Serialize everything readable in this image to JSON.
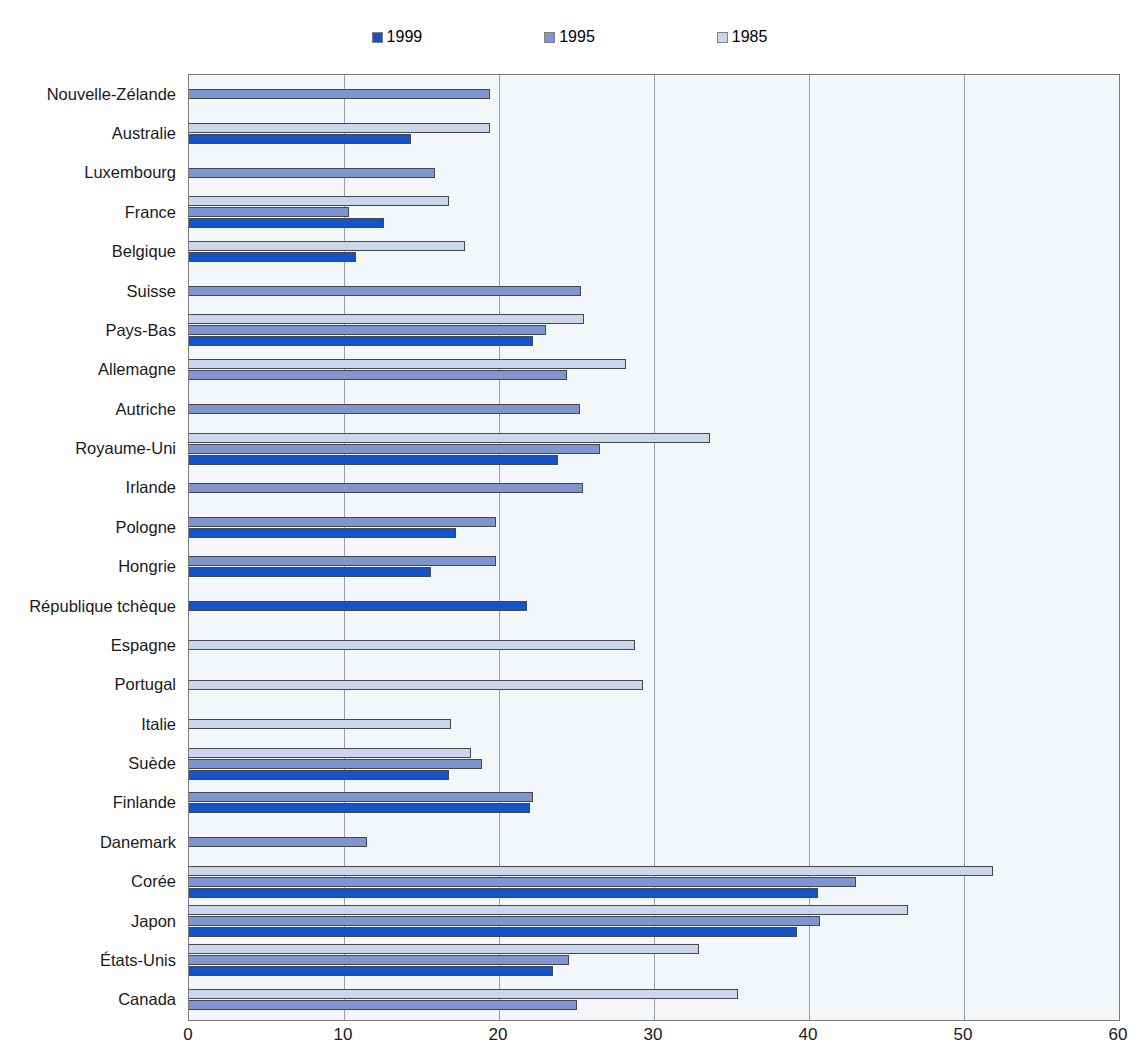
{
  "title": "",
  "legend": {
    "position": "top-center",
    "items": [
      {
        "label": "1999",
        "color": "#1553c8",
        "swatch_name": "legend-swatch-1999"
      },
      {
        "label": "1995",
        "color": "#7f95cf",
        "swatch_name": "legend-swatch-1995"
      },
      {
        "label": "1985",
        "color": "#ccd6ea",
        "swatch_name": "legend-swatch-1985"
      }
    ]
  },
  "chart_data": {
    "type": "bar",
    "orientation": "horizontal",
    "title": "",
    "xlabel": "",
    "ylabel": "",
    "xlim": [
      0,
      60
    ],
    "xticks": [
      0,
      10,
      20,
      30,
      40,
      50,
      60
    ],
    "xtick_labels": [
      "0",
      "10",
      "20",
      "30",
      "40",
      "50",
      "60"
    ],
    "grid": "vertical",
    "legend_position": "top-center",
    "categories": [
      "Nouvelle-Zélande",
      "Australie",
      "Luxembourg",
      "France",
      "Belgique",
      "Suisse",
      "Pays-Bas",
      "Allemagne",
      "Autriche",
      "Royaume-Uni",
      "Irlande",
      "Pologne",
      "Hongrie",
      "République tchèque",
      "Espagne",
      "Portugal",
      "Italie",
      "Suède",
      "Finlande",
      "Danemark",
      "Corée",
      "Japon",
      "États-Unis",
      "Canada"
    ],
    "series": [
      {
        "name": "1999",
        "color": "#1553c8",
        "values": [
          null,
          14.3,
          null,
          12.6,
          10.8,
          null,
          22.2,
          null,
          null,
          23.8,
          null,
          17.2,
          15.6,
          21.8,
          null,
          null,
          null,
          16.8,
          22.0,
          null,
          40.6,
          39.2,
          23.5,
          null
        ]
      },
      {
        "name": "1995",
        "color": "#7f95cf",
        "values": [
          19.4,
          null,
          15.9,
          10.3,
          null,
          25.3,
          23.0,
          24.4,
          25.2,
          26.5,
          25.4,
          19.8,
          19.8,
          null,
          null,
          null,
          null,
          18.9,
          22.2,
          11.5,
          43.0,
          40.7,
          24.5,
          25.0
        ]
      },
      {
        "name": "1985",
        "color": "#ccd6ea",
        "values": [
          null,
          19.4,
          null,
          16.8,
          17.8,
          null,
          25.5,
          28.2,
          null,
          33.6,
          null,
          null,
          null,
          null,
          28.8,
          29.3,
          16.9,
          18.2,
          null,
          null,
          51.9,
          46.4,
          32.9,
          35.4
        ]
      }
    ]
  }
}
